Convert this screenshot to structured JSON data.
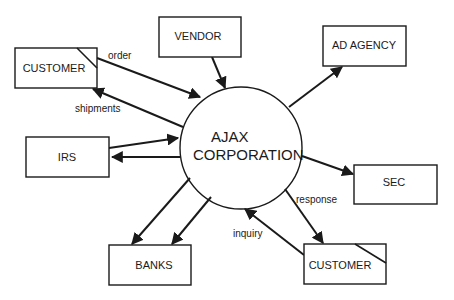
{
  "diagram": {
    "type": "context data flow diagram",
    "process": {
      "line1": "AJAX",
      "line2": "CORPORATION"
    },
    "entities": {
      "customer_top": "CUSTOMER",
      "vendor": "VENDOR",
      "ad_agency": "AD AGENCY",
      "irs": "IRS",
      "sec": "SEC",
      "banks": "BANKS",
      "customer_bottom": "CUSTOMER"
    },
    "flows": {
      "order": "order",
      "shipments": "shipments",
      "response": "response",
      "inquiry": "inquiry"
    },
    "colors": {
      "stroke": "#1a1a1a",
      "background": "#ffffff"
    }
  }
}
